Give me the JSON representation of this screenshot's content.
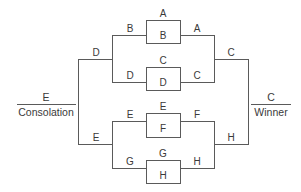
{
  "diagram": {
    "type": "tournament-bracket",
    "round1": [
      {
        "top": "A",
        "bottom": "B",
        "winner": "A",
        "loser": "B"
      },
      {
        "top": "C",
        "bottom": "D",
        "winner": "C",
        "loser": "D"
      },
      {
        "top": "E",
        "bottom": "F",
        "winner": "F",
        "loser": "E"
      },
      {
        "top": "G",
        "bottom": "H",
        "winner": "H",
        "loser": "G"
      }
    ],
    "winners_bracket": {
      "round2_labels": [
        "A",
        "C",
        "F",
        "H"
      ],
      "semi_labels": [
        "C",
        "H"
      ],
      "final_winner": "C",
      "final_label": "Winner"
    },
    "consolation_bracket": {
      "round2_labels": [
        "B",
        "D",
        "E",
        "G"
      ],
      "semi_labels": [
        "D",
        "E"
      ],
      "final_winner": "E",
      "final_label": "Consolation"
    }
  }
}
